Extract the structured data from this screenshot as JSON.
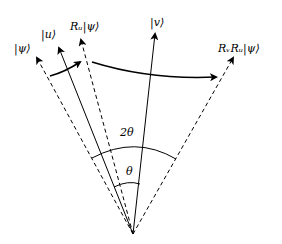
{
  "diagram": {
    "type": "vector-rotation",
    "labels": {
      "psi": "|ψ⟩",
      "u": "|u⟩",
      "ru_psi": "Rᵤ|ψ⟩",
      "v": "|v⟩",
      "rvru_psi": "RᵥRᵤ|ψ⟩",
      "two_theta": "2θ",
      "theta": "θ"
    },
    "vectors": [
      {
        "name": "psi",
        "style": "dashed",
        "tip": [
          37,
          58
        ]
      },
      {
        "name": "u",
        "style": "solid",
        "tip": [
          59,
          48
        ]
      },
      {
        "name": "ru_psi",
        "style": "dashed",
        "tip": [
          81,
          40
        ]
      },
      {
        "name": "v",
        "style": "solid",
        "tip": [
          155,
          34
        ]
      },
      {
        "name": "rvru_psi",
        "style": "dashed",
        "tip": [
          233,
          58
        ]
      }
    ],
    "origin": [
      133,
      234
    ],
    "colors": {
      "stroke": "#000000",
      "background": "#ffffff"
    }
  }
}
